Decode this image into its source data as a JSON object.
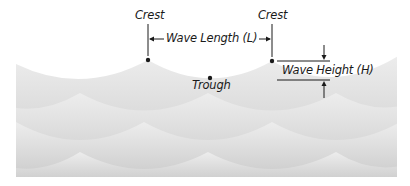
{
  "diagram": {
    "labels": {
      "crest_left": "Crest",
      "crest_right": "Crest",
      "wave_length": "Wave Length (L)",
      "trough": "Trough",
      "wave_height": "Wave Height (H)"
    },
    "colors": {
      "background": "#ffffff",
      "wave_light": "#ececec",
      "wave_dark": "#c9c9c9",
      "ink": "#1a1a1a"
    },
    "points": {
      "crest_left": {
        "x": 148,
        "y": 60
      },
      "crest_right": {
        "x": 272,
        "y": 61
      },
      "trough": {
        "x": 210,
        "y": 78
      }
    }
  }
}
